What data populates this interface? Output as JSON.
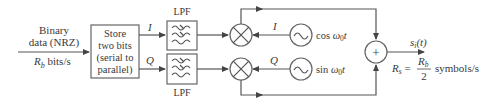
{
  "diagram": {
    "input": {
      "label_line1": "Binary",
      "label_line2": "data (NRZ)",
      "rate_symbol": "R",
      "rate_sub": "b",
      "rate_unit": " bits/s"
    },
    "serial_to_parallel": {
      "line1": "Store",
      "line2": "two bits",
      "line3": "(serial to",
      "line4": "parallel)"
    },
    "branches": {
      "i_label": "I",
      "q_label": "Q"
    },
    "filters": {
      "top_label": "LPF",
      "bottom_label": "LPF"
    },
    "oscillators": {
      "i_label": "I",
      "q_label": "Q",
      "cos_text": "cos ",
      "cos_omega": "ω",
      "cos_sub": "0",
      "cos_t": "t",
      "sin_text": "sin ",
      "sin_omega": "ω",
      "sin_sub": "0",
      "sin_t": "t"
    },
    "summer": {
      "symbol": "+"
    },
    "output": {
      "signal": "s",
      "signal_sub": "i",
      "signal_arg": "(t)",
      "rate_symbol": "R",
      "rate_sub": "s",
      "equals": " = ",
      "numerator": "R",
      "numerator_sub": "b",
      "denominator": "2",
      "rate_unit": "symbols/s"
    },
    "colors": {
      "line": "#555555",
      "text": "#3a3a3a",
      "background": "#ffffff"
    }
  }
}
